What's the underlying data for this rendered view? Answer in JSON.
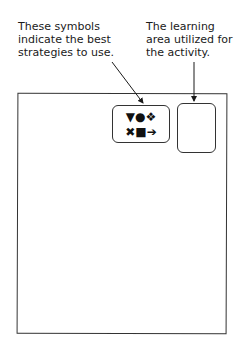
{
  "captions": {
    "symbols_caption": [
      "These symbols",
      "indicate the best",
      "strategies to use."
    ],
    "area_caption": [
      "The learning",
      "area utilized for",
      "the activity."
    ]
  },
  "symbols_box": {
    "row1": [
      "▼",
      "●",
      "❖"
    ],
    "row2": [
      "✖",
      "■",
      "➔"
    ],
    "row1_text": "▼●❖",
    "row2_text": "✖■➔"
  },
  "area_box": {
    "content": ""
  },
  "colors": {
    "ink": "#1a1a1a",
    "background": "#ffffff"
  }
}
